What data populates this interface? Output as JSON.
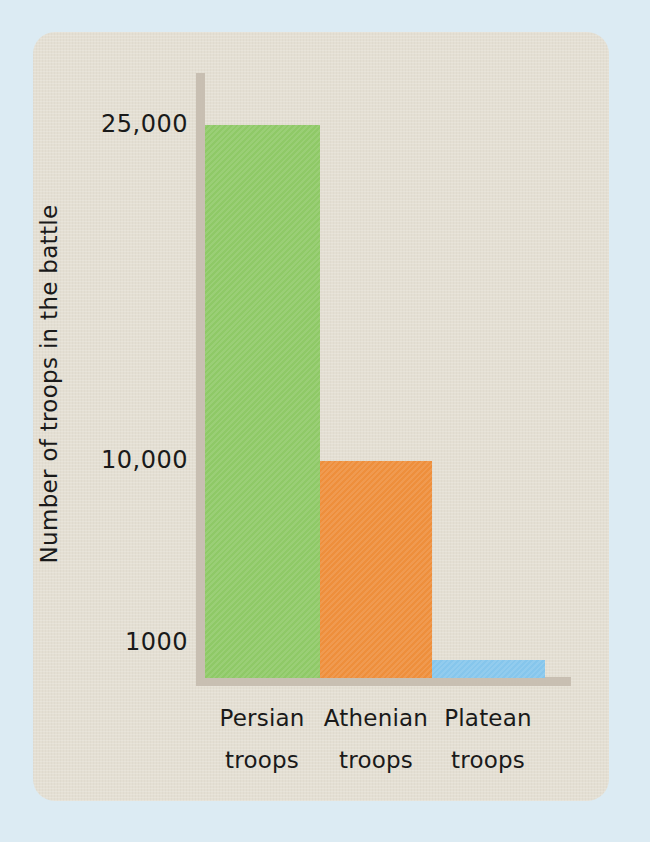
{
  "canvas": {
    "background_color": "#dcebf3",
    "card_color": "#e4dfd3",
    "axis_color": "#c8bfb2"
  },
  "chart_data": {
    "type": "bar",
    "title": "",
    "xlabel": "",
    "ylabel": "Number of troops in the battle",
    "categories": [
      "Persian troops",
      "Athenian troops",
      "Platean troops"
    ],
    "category_lines": [
      {
        "line1": "Persian",
        "line2": "troops"
      },
      {
        "line1": "Athenian",
        "line2": "troops"
      },
      {
        "line1": "Platean",
        "line2": "troops"
      }
    ],
    "values": [
      25000,
      10000,
      1000
    ],
    "value_labels": [
      "25,000",
      "10,000",
      "1000"
    ],
    "ytick_labels": [
      "25,000",
      "10,000",
      "1000"
    ],
    "ytick_values": [
      25000,
      10000,
      1000
    ],
    "ylim": [
      0,
      25000
    ],
    "grid": false,
    "legend": null,
    "bar_colors": [
      "#8fc967",
      "#ee8f3c",
      "#86c6ec"
    ],
    "series": [
      {
        "name": "Number of troops in the battle",
        "points": [
          {
            "category": "Persian troops",
            "value": 25000,
            "color": "#8fc967"
          },
          {
            "category": "Athenian troops",
            "value": 10000,
            "color": "#ee8f3c"
          },
          {
            "category": "Platean troops",
            "value": 1000,
            "color": "#86c6ec"
          }
        ]
      }
    ]
  }
}
